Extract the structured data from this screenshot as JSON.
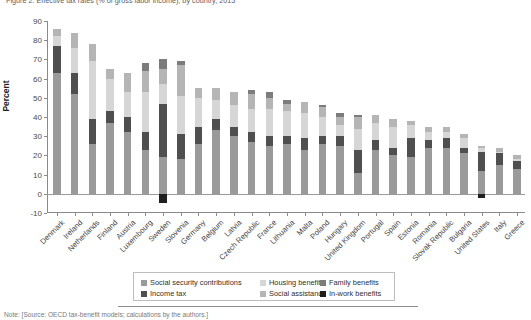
{
  "figure": {
    "title": "Figure 2. Effective tax rates (% of gross labor income), by country, 2015",
    "footer": "Note: [Source: OECD tax-benefit models; calculations by the authors.]"
  },
  "chart_data": {
    "type": "bar",
    "stacked": true,
    "title": "Effective tax rates (% of gross labor income), by country, 2015",
    "xlabel": "",
    "ylabel": "Percent",
    "ylim": [
      -10,
      90
    ],
    "yticks": [
      -10,
      0,
      10,
      20,
      30,
      40,
      50,
      60,
      70,
      80,
      90
    ],
    "ytick_labels": [
      "-10",
      "0",
      "10",
      "20",
      "30",
      "40",
      "50",
      "60",
      "70",
      "80",
      "90"
    ],
    "grid": false,
    "legend_position": "bottom-center",
    "legend_columns": 3,
    "categories": [
      "Denmark",
      "Ireland",
      "Netherlands",
      "Finland",
      "Austria",
      "Luxembourg",
      "Sweden",
      "Slovenia",
      "Germany",
      "Belgium",
      "Latvia",
      "Czech Republic",
      "France",
      "Lithuania",
      "Malta",
      "Poland",
      "Hungary",
      "United Kingdom",
      "Portugal",
      "Spain",
      "Estonia",
      "Romania",
      "Slovak Republic",
      "Bulgaria",
      "United States",
      "Italy",
      "Greece"
    ],
    "series": [
      {
        "name": "Social security contributions",
        "color": "#9a9a9a",
        "values": [
          63,
          52,
          26,
          37,
          32,
          23,
          19,
          18,
          26,
          33,
          30,
          27,
          25,
          26,
          23,
          26,
          25,
          11,
          23,
          20,
          19,
          24,
          24,
          21,
          12,
          15,
          13
        ]
      },
      {
        "name": "Income tax",
        "color": "#4f4f4f",
        "values": [
          14,
          11,
          13,
          6,
          8,
          9,
          28,
          13,
          9,
          6,
          5,
          5,
          5,
          4,
          6,
          4,
          5,
          12,
          5,
          4,
          10,
          4,
          5,
          3,
          10,
          6,
          4
        ]
      },
      {
        "name": "Housing benefits",
        "color": "#d6d6d6",
        "values": [
          5,
          13,
          30,
          17,
          13,
          21,
          10,
          20,
          15,
          10,
          11,
          12,
          14,
          13,
          13,
          10,
          6,
          11,
          9,
          11,
          7,
          4,
          3,
          5,
          2,
          1,
          1
        ]
      },
      {
        "name": "Social assistance",
        "color": "#b5b5b5",
        "values": [
          4,
          8,
          9,
          5,
          10,
          11,
          8,
          16,
          5,
          6,
          7,
          8,
          6,
          4,
          6,
          5,
          4,
          6,
          4,
          4,
          2,
          3,
          3,
          2,
          1,
          2,
          2
        ]
      },
      {
        "name": "Family benefits",
        "color": "#7c7c7c",
        "values": [
          0,
          0,
          0,
          0,
          0,
          4,
          5,
          2,
          0,
          0,
          0,
          2,
          3,
          2,
          0,
          1,
          2,
          1,
          0,
          0,
          0,
          0,
          0,
          0,
          0,
          0,
          0
        ]
      },
      {
        "name": "In-work benefits",
        "color": "#1f1f1f",
        "values": [
          0,
          0,
          0,
          0,
          0,
          0,
          -5,
          0,
          0,
          0,
          0,
          0,
          0,
          0,
          0,
          0,
          0,
          0,
          0,
          0,
          0,
          0,
          0,
          0,
          -2,
          0,
          0
        ]
      }
    ],
    "totals": [
      86,
      84,
      78,
      65,
      63,
      68,
      70,
      69,
      55,
      55,
      53,
      54,
      53,
      49,
      48,
      46,
      42,
      41,
      41,
      39,
      38,
      35,
      35,
      31,
      25,
      24,
      20
    ]
  },
  "legend": {
    "items": [
      {
        "label": "Social security contributions",
        "color": "#9a9a9a"
      },
      {
        "label": "Income tax",
        "color": "#4f4f4f"
      },
      {
        "label": "Housing benefits",
        "color": "#d6d6d6"
      },
      {
        "label": "Social assistance",
        "color": "#b5b5b5"
      },
      {
        "label": "Family benefits",
        "color": "#7c7c7c"
      },
      {
        "label": "In-work benefits",
        "color": "#1f1f1f"
      }
    ]
  }
}
